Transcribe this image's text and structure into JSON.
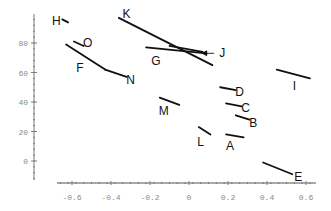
{
  "chart_data": {
    "type": "line",
    "title": "",
    "xlabel": "",
    "ylabel": "",
    "xlim": [
      -0.7,
      0.65
    ],
    "ylim": [
      -13,
      100
    ],
    "grid": false,
    "legend": null,
    "x_ticks": [
      -0.6,
      -0.4,
      -0.2,
      0,
      0.2,
      0.4,
      0.6
    ],
    "x_tick_labels": [
      "-0.6",
      "-0.4",
      "-0.2",
      "0",
      "0.2",
      "0.4",
      "0.6"
    ],
    "y_ticks": [
      0,
      20,
      40,
      60,
      80
    ],
    "y_tick_labels": [
      "0",
      "20",
      "40",
      "60",
      "80"
    ],
    "series": [
      {
        "name": "H",
        "x": [
          -0.65,
          -0.62
        ],
        "y": [
          96,
          94
        ],
        "label_pos": [
          -0.68,
          95
        ]
      },
      {
        "name": "O",
        "x": [
          -0.59,
          -0.54
        ],
        "y": [
          81,
          78
        ],
        "label_pos": [
          -0.52,
          80
        ]
      },
      {
        "name": "F",
        "x": [
          -0.63,
          -0.43
        ],
        "y": [
          79,
          62
        ],
        "label_pos": [
          -0.56,
          63
        ]
      },
      {
        "name": "N",
        "x": [
          -0.43,
          -0.32
        ],
        "y": [
          62,
          57
        ],
        "label_pos": [
          -0.3,
          55
        ]
      },
      {
        "name": "K",
        "x": [
          -0.36,
          0.12
        ],
        "y": [
          97,
          65
        ],
        "label_pos": [
          -0.32,
          100
        ]
      },
      {
        "name": "G",
        "x": [
          -0.22,
          0.09
        ],
        "y": [
          77,
          73
        ],
        "label_pos": [
          -0.17,
          68
        ]
      },
      {
        "name": "J",
        "x": [
          -0.1,
          0.07
        ],
        "y": [
          78,
          74
        ],
        "label_pos": [
          0.17,
          73
        ],
        "arrow": true
      },
      {
        "name": "D",
        "x": [
          0.16,
          0.24
        ],
        "y": [
          50,
          48
        ],
        "label_pos": [
          0.26,
          47
        ]
      },
      {
        "name": "C",
        "x": [
          0.19,
          0.27
        ],
        "y": [
          39,
          37
        ],
        "label_pos": [
          0.29,
          36
        ]
      },
      {
        "name": "B",
        "x": [
          0.24,
          0.31
        ],
        "y": [
          31,
          28
        ],
        "label_pos": [
          0.33,
          26
        ]
      },
      {
        "name": "A",
        "x": [
          0.19,
          0.28
        ],
        "y": [
          18,
          16
        ],
        "label_pos": [
          0.21,
          10
        ]
      },
      {
        "name": "L",
        "x": [
          0.05,
          0.11
        ],
        "y": [
          23,
          18
        ],
        "label_pos": [
          0.06,
          13
        ]
      },
      {
        "name": "M",
        "x": [
          -0.15,
          -0.05
        ],
        "y": [
          43,
          38
        ],
        "label_pos": [
          -0.13,
          34
        ]
      },
      {
        "name": "I",
        "x": [
          0.45,
          0.62
        ],
        "y": [
          62,
          56
        ],
        "label_pos": [
          0.54,
          51
        ]
      },
      {
        "name": "E",
        "x": [
          0.38,
          0.53
        ],
        "y": [
          -1,
          -9
        ],
        "label_pos": [
          0.56,
          -11
        ]
      }
    ]
  }
}
